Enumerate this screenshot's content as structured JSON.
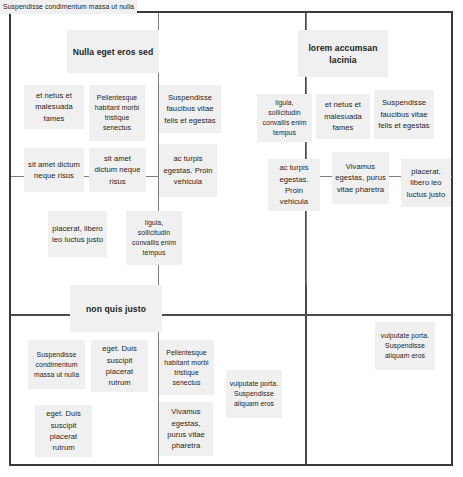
{
  "diagram": {
    "kind": "mind-map",
    "colors": {
      "canvas": "#ffffff",
      "frame_border": "#3a3a3a",
      "divider": "#4a4a4a",
      "connector": "#7d7d7d",
      "node_fill": "#f0f0f0",
      "node_text": "#1d1d1d"
    },
    "titles": {
      "top_left": "Nulla eget eros sed",
      "top_right": "lorem accumsan lacinia",
      "bottom_left": "non quis justo"
    },
    "nodes": {
      "n01": "et netus et malesuada fames",
      "n02": "Pellentesque habitant morbi tristique senectus",
      "n03": "Suspendisse faucibus vitae felis et egestas",
      "n04": "sit amet dictum neque risus",
      "n05": "sit amet dictum neque risus",
      "n06": "ac turpis egestas. Proin vehicula",
      "n07": "placerat, libero leo luctus justo",
      "n08": "ligula, sollicitudin convallis enim tempus",
      "n09": "ligula, sollicitudin convallis enim tempus",
      "n10": "et netus et malesuada fames",
      "n11": "Suspendisse faucibus vitae felis et egestas",
      "n12": "ac turpis egestas. Proin vehicula",
      "n13": "Vivamus egestas, purus vitae pharetra",
      "n14": "placerat, libero leo luctus justo",
      "n15": "Suspendisse condimentum massa ut nulla",
      "n16": "eget. Duis suscipit placerat rutrum",
      "n17": "Pellentesque habitant morbi tristique senectus",
      "n18": "eget. Duis suscipit placerat rutrum",
      "n19": "Suspendisse condimentum massa ut nulla",
      "n20": "Vivamus egestas, purus vitae pharetra",
      "n21": "vulputate porta. Suspendisse aliquam eros",
      "n22": "vulputate porta. Suspendisse aliquam eros"
    }
  }
}
